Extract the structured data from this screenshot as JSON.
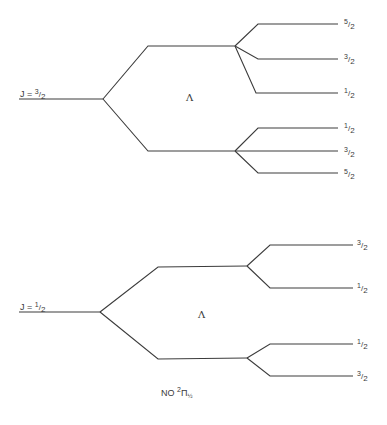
{
  "diagram": {
    "title": {
      "molecule": "NO",
      "multiplicity": "2",
      "term": "Π",
      "omega": "½"
    },
    "top": {
      "level_label": "J = ",
      "J": {
        "num": "3",
        "den": "2"
      },
      "lambda_symbol": "Λ",
      "upper_branch_F": [
        {
          "num": "5",
          "den": "2"
        },
        {
          "num": "3",
          "den": "2"
        },
        {
          "num": "1",
          "den": "2"
        }
      ],
      "lower_branch_F": [
        {
          "num": "1",
          "den": "2"
        },
        {
          "num": "3",
          "den": "2"
        },
        {
          "num": "5",
          "den": "2"
        }
      ]
    },
    "bottom": {
      "level_label": "J = ",
      "J": {
        "num": "1",
        "den": "2"
      },
      "lambda_symbol": "Λ",
      "upper_branch_F": [
        {
          "num": "3",
          "den": "2"
        },
        {
          "num": "1",
          "den": "2"
        }
      ],
      "lower_branch_F": [
        {
          "num": "1",
          "den": "2"
        },
        {
          "num": "3",
          "den": "2"
        }
      ]
    },
    "line_color": "#3c3c3c"
  }
}
